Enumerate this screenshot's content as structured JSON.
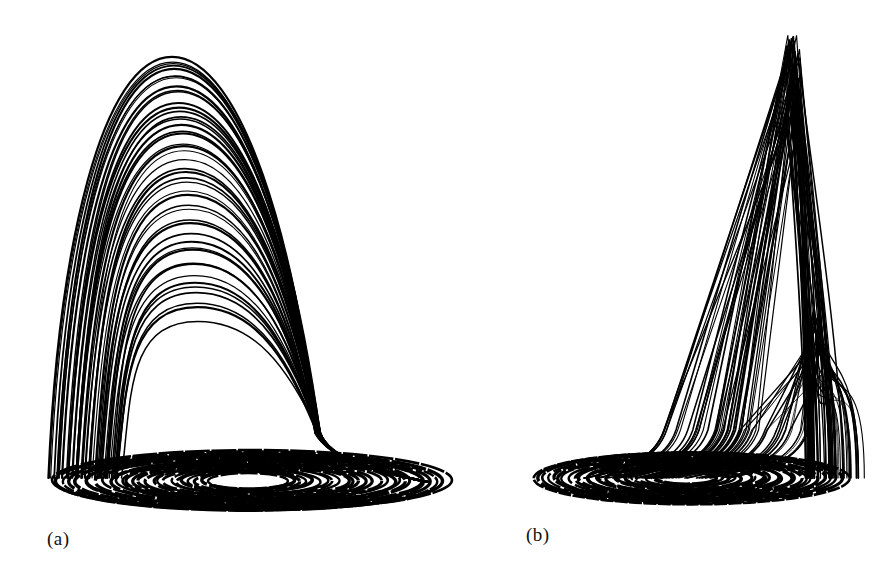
{
  "figure": {
    "panels": [
      {
        "id": "a",
        "label": "(a)",
        "description": "Chaotic attractor projection: spiral base with tall bell-shaped folded loops",
        "stroke_color": "#000000",
        "base": {
          "cx": 248,
          "cy": 481,
          "rx_min": 40,
          "rx_max": 200,
          "ry_min": 8,
          "ry_max": 30,
          "rings": 26
        },
        "arches": {
          "left_x_min": 50,
          "left_x_max": 120,
          "right_x": 318,
          "base_y": 478,
          "peak_x_min": 172,
          "peak_x_max": 198,
          "peak_y_min": 58,
          "peak_y_max": 318,
          "count": 46
        }
      },
      {
        "id": "b",
        "label": "(b)",
        "description": "Same attractor, different projection: spiral base with tall narrow spikes on the right",
        "stroke_color": "#000000",
        "base": {
          "cx": 685,
          "cy": 478,
          "rx_min": 30,
          "rx_max": 158,
          "ry_min": 6,
          "ry_max": 26,
          "rings": 24
        },
        "spikes": {
          "base_y": 470,
          "left_x_min": 640,
          "left_x_max": 740,
          "peak_x_min": 785,
          "peak_x_max": 800,
          "peak_y_min": 35,
          "peak_y_max": 130,
          "count": 40
        },
        "secondary_spikes": {
          "base_y": 470,
          "left_x_min": 720,
          "left_x_max": 790,
          "peak_x_min": 812,
          "peak_x_max": 822,
          "peak_y_min": 310,
          "peak_y_max": 380,
          "count": 22
        }
      }
    ]
  }
}
